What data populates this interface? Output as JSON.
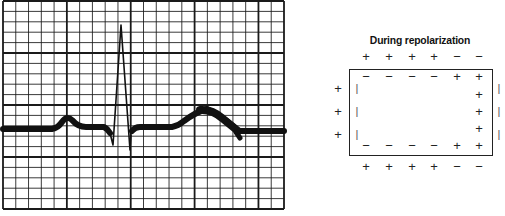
{
  "figure": {
    "ecg_strip": {
      "description": "ECG tracing on grid paper showing P wave, QRS complex and T wave",
      "grid": {
        "x_start": 3,
        "x_end": 284,
        "y_start": 1,
        "y_end": 209,
        "columns": 22,
        "rows": 20,
        "major_every": 5,
        "line_color": "#1a1a1a"
      },
      "trace_color": "#111111",
      "waves": [
        "P",
        "QRS",
        "T"
      ]
    },
    "repolarization_diagram": {
      "title": "During repolarization",
      "outer_top": [
        "+",
        "+",
        "+",
        "+",
        "−",
        "−"
      ],
      "inner_top": [
        "−",
        "−",
        "−",
        "−",
        "+",
        "+"
      ],
      "inner_bottom": [
        "−",
        "−",
        "−",
        "−",
        "+",
        "+"
      ],
      "outer_bottom": [
        "+",
        "+",
        "+",
        "+",
        "−",
        "−"
      ],
      "outer_left": [
        "+",
        "+",
        "+"
      ],
      "inner_left": [
        "|",
        "|",
        "|"
      ],
      "inner_right": [
        "+",
        "+",
        "+"
      ],
      "outer_right": [
        "|",
        "|",
        "|"
      ]
    }
  }
}
